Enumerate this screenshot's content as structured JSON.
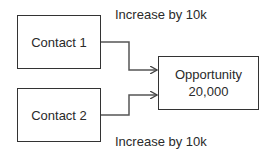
{
  "nodes": {
    "contact1": {
      "label": "Contact 1"
    },
    "contact2": {
      "label": "Contact 2"
    },
    "opportunity": {
      "title": "Opportunity",
      "value": "20,000"
    }
  },
  "edges": [
    {
      "from": "contact1",
      "to": "opportunity",
      "label": "Increase by 10k"
    },
    {
      "from": "contact2",
      "to": "opportunity",
      "label": "Increase by 10k"
    }
  ],
  "colors": {
    "stroke": "#333333",
    "text": "#2a2a2a",
    "background": "#ffffff"
  }
}
